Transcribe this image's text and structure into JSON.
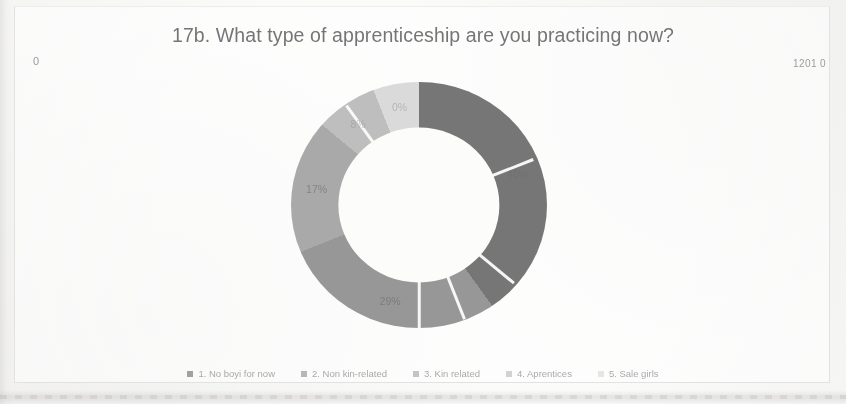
{
  "title": "17b. What type of apprenticeship are you practicing now?",
  "corner_labels": {
    "left": "0",
    "right": "1201 0"
  },
  "legend": {
    "items": [
      {
        "label": "1. No boyi for now",
        "color": "#6b6b6b"
      },
      {
        "label": "2. Non kin-related",
        "color": "#8f8f8f"
      },
      {
        "label": "3. Kin related",
        "color": "#a3a3a3"
      },
      {
        "label": "4. Aprentices",
        "color": "#b9b9b9"
      },
      {
        "label": "5. Sale girls",
        "color": "#d8d8d8"
      }
    ]
  },
  "chart_data": {
    "type": "pie",
    "variant": "doughnut",
    "title": "17b. What type of apprenticeship are you practicing now?",
    "categories": [
      "1. No boyi for now",
      "2. Non kin-related",
      "3. Kin related",
      "4. Aprentices",
      "5. Sale girls"
    ],
    "values": [
      40,
      29,
      17,
      8,
      6
    ],
    "data_labels": [
      "40%",
      "29%",
      "17%",
      "8%",
      "0%"
    ],
    "colors": [
      "#6b6b6b",
      "#8f8f8f",
      "#a3a3a3",
      "#b9b9b9",
      "#d8d8d8"
    ],
    "legend_position": "bottom",
    "start_angle": 0,
    "grid": false
  }
}
